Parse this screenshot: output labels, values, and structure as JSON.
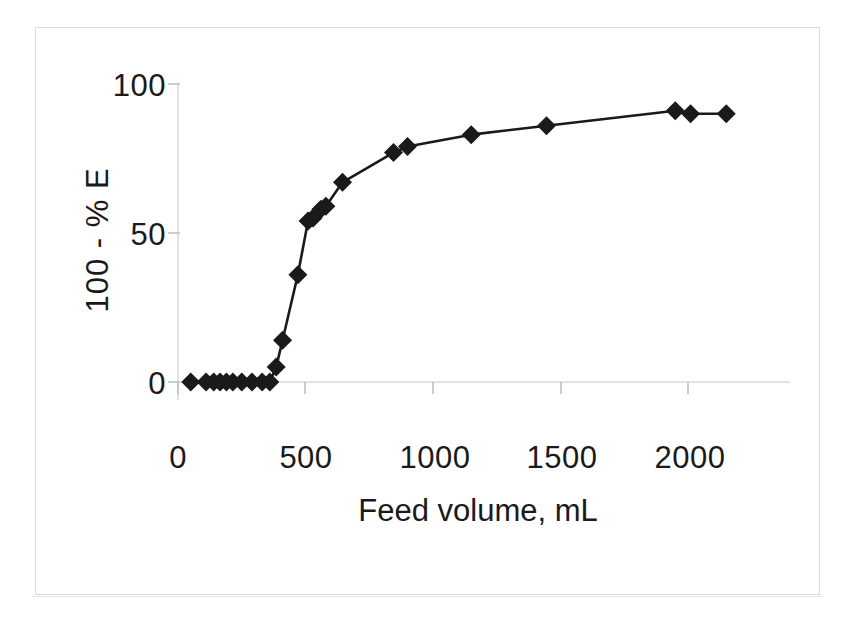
{
  "figure": {
    "frame_color": "#dcdcdc",
    "background": "#ffffff"
  },
  "chart_data": {
    "type": "line",
    "title": "",
    "subtitle": "",
    "xlabel": "Feed volume, mL",
    "ylabel": "100 - % E",
    "xlim": [
      0,
      2300
    ],
    "ylim": [
      0,
      100
    ],
    "xticks": [
      0,
      500,
      1000,
      1500,
      2000
    ],
    "xtick_labels": [
      "0",
      "500",
      "1000",
      "1500",
      "2000"
    ],
    "yticks": [
      0,
      50,
      100
    ],
    "ytick_labels": [
      "0",
      "50",
      "100"
    ],
    "grid": false,
    "legend": null,
    "marker": "diamond",
    "marker_color": "#1a1a1a",
    "line_color": "#1a1a1a",
    "series": [
      {
        "name": "100 - % E",
        "x": [
          50,
          110,
          140,
          165,
          190,
          215,
          250,
          290,
          330,
          360,
          385,
          410,
          470,
          510,
          530,
          560,
          580,
          645,
          845,
          900,
          1150,
          1445,
          1950,
          2010,
          2150
        ],
        "y": [
          0,
          0,
          0,
          0,
          0,
          0,
          0,
          0,
          0,
          0,
          5,
          14,
          36,
          54,
          55,
          58,
          59,
          67,
          77,
          79,
          83,
          86,
          91,
          90,
          90
        ]
      }
    ]
  },
  "axes": {
    "y_axis_label": "100 - % E",
    "x_axis_label": "Feed volume, mL"
  }
}
